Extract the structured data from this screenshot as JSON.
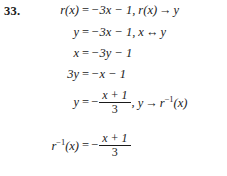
{
  "problem": {
    "number": "33.",
    "topic": "inverse-function-derivation"
  },
  "steps": [
    {
      "id": "step-1",
      "lhs": "r(x)",
      "equals": "=",
      "rhs": "−3x − 1,",
      "annotation_lhs": "r(x)",
      "annotation_arrow": "→",
      "annotation_rhs": "y",
      "text": "r(x) = −3x − 1, r(x) → y"
    },
    {
      "id": "step-2",
      "lhs": "y",
      "equals": "=",
      "rhs": "−3x − 1,",
      "annotation_lhs": "x",
      "annotation_arrow": "↔",
      "annotation_rhs": "y",
      "text": "y = −3x − 1, x ↔ y"
    },
    {
      "id": "step-3",
      "lhs": "x",
      "equals": "=",
      "rhs": "−3y − 1",
      "text": "x = −3y − 1"
    },
    {
      "id": "step-4",
      "lhs": "3y",
      "equals": "=",
      "rhs": "−x − 1",
      "text": "3y = −x − 1"
    },
    {
      "id": "step-5",
      "lhs": "y",
      "equals": "=",
      "sign": "−",
      "numerator": "x + 1",
      "denominator": "3",
      "comma": ",",
      "annotation_lhs": "y",
      "annotation_arrow": "→",
      "annotation_rhs_base": "r",
      "annotation_rhs_sup": "−1",
      "annotation_rhs_arg": "(x)",
      "text": "y = −(x + 1)/3,  y → r⁻¹(x)"
    },
    {
      "id": "step-6",
      "lhs_base": "r",
      "lhs_sup": "−1",
      "lhs_arg": "(x)",
      "equals": "=",
      "sign": "−",
      "numerator": "x + 1",
      "denominator": "3",
      "text": "r⁻¹(x) = −(x + 1)/3"
    }
  ],
  "colors": {
    "ink": "#1a1a1a",
    "page": "#ffffff"
  }
}
